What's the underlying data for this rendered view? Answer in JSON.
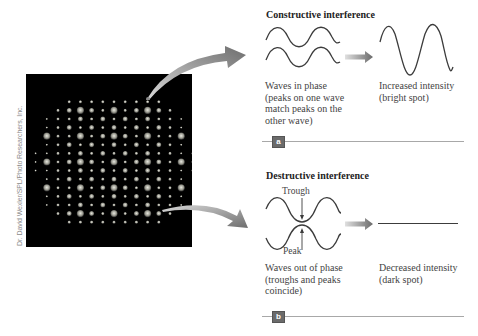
{
  "credit": "Dr. David Wexler/SPL/Photo Researchers, Inc.",
  "photo": {
    "description": "X-ray diffraction pattern of spots on black background",
    "background": "#000000"
  },
  "constructive": {
    "heading": "Constructive interference",
    "left_caption": [
      "Waves in phase",
      "(peaks on one wave",
      "match peaks on the",
      "other wave)"
    ],
    "right_caption": [
      "Increased intensity",
      "(bright spot)"
    ],
    "panel_label": "a"
  },
  "destructive": {
    "heading": "Destructive interference",
    "trough_label": "Trough",
    "peak_label": "Peak",
    "left_caption": [
      "Waves out of phase",
      "(troughs and peaks",
      "coincide)"
    ],
    "right_caption": [
      "Decreased intensity",
      "(dark spot)"
    ],
    "panel_label": "b"
  },
  "colors": {
    "wave": "#3c3c3c",
    "arrow": "#7a7a7a",
    "rule": "#a8a8a8"
  }
}
